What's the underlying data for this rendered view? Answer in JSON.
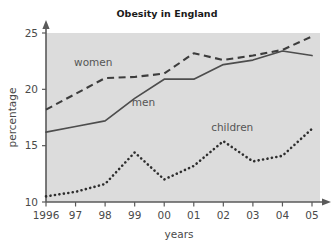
{
  "chart_data": {
    "type": "line",
    "title": "Obesity in England",
    "xlabel": "years",
    "ylabel": "percentage",
    "x": [
      1996,
      1997,
      1998,
      1999,
      2000,
      2001,
      2002,
      2003,
      2004,
      2005
    ],
    "xtick_labels": [
      "1996",
      "97",
      "98",
      "99",
      "00",
      "01",
      "02",
      "03",
      "04",
      "05"
    ],
    "ytick_labels": [
      "10",
      "15",
      "20",
      "25"
    ],
    "ytick_values": [
      10,
      15,
      20,
      25
    ],
    "xlim": [
      1996,
      2005
    ],
    "ylim": [
      10,
      25
    ],
    "grid": false,
    "legend_position": "inline-annotations",
    "series": [
      {
        "name": "women",
        "style": "dashed",
        "color": "#3d3d3d",
        "values": [
          18.2,
          19.6,
          21.0,
          21.1,
          21.4,
          23.2,
          22.6,
          23.0,
          23.5,
          24.7
        ]
      },
      {
        "name": "men",
        "style": "solid",
        "color": "#4d4d4d",
        "values": [
          16.2,
          16.7,
          17.2,
          19.2,
          20.9,
          20.9,
          22.2,
          22.6,
          23.4,
          23.0
        ]
      },
      {
        "name": "children",
        "style": "dotted",
        "color": "#2e2e2e",
        "values": [
          10.5,
          10.9,
          11.6,
          14.4,
          12.0,
          13.2,
          15.4,
          13.6,
          14.1,
          16.5
        ]
      }
    ],
    "annotations": [
      {
        "text": "women",
        "x": 1997.6,
        "y": 22.1
      },
      {
        "text": "men",
        "x": 1999.3,
        "y": 18.5
      },
      {
        "text": "children",
        "x": 2002.3,
        "y": 16.3
      }
    ],
    "colors": {
      "plot_background": "#cfcfcf",
      "page_background": "#ffffff",
      "axis": "#5a5a5a",
      "text": "#4a4a4a",
      "title_text": "#1a1a1a"
    }
  }
}
